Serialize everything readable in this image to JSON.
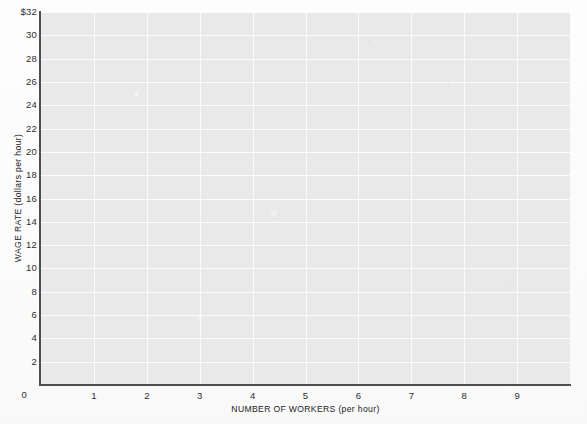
{
  "chart_data": {
    "type": "line",
    "title": "",
    "subtitle": "",
    "xlabel": "NUMBER OF WORKERS (per hour)",
    "ylabel": "WAGE RATE (dollars per hour)",
    "xlim": [
      0,
      10
    ],
    "ylim": [
      0,
      32
    ],
    "xticks": [
      0,
      1,
      2,
      3,
      4,
      5,
      6,
      7,
      8,
      9
    ],
    "xtick_labels": [
      "0",
      "1",
      "2",
      "3",
      "4",
      "5",
      "6",
      "7",
      "8",
      "9"
    ],
    "yticks": [
      2,
      4,
      6,
      8,
      10,
      12,
      14,
      16,
      18,
      20,
      22,
      24,
      26,
      28,
      30,
      32
    ],
    "ytick_labels": [
      "2",
      "4",
      "6",
      "8",
      "10",
      "12",
      "14",
      "16",
      "18",
      "20",
      "22",
      "24",
      "26",
      "28",
      "30",
      "$32"
    ],
    "y_origin_label": "0",
    "grid": true,
    "grid_color": "#fbfbfb",
    "plot_background": "#e9e9e9",
    "axis_color": "#4f4f4f",
    "legend": [],
    "series": [],
    "annotations": []
  },
  "figure": {
    "axis_title_x": "NUMBER OF WORKERS (per hour)",
    "axis_title_y": "WAGE RATE (dollars per hour)"
  }
}
